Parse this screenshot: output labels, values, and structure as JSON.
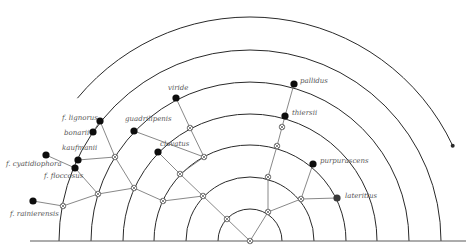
{
  "diagram": {
    "type": "phylogenetic-semicircle-tree",
    "center": {
      "x": 250,
      "y": 241
    },
    "radii": [
      32,
      64,
      96,
      127,
      159,
      191,
      224
    ],
    "colors": {
      "arc": "#2a2a2a",
      "edge": "#6a6a6a",
      "leaf": "#0d0d0d",
      "label": "#555555"
    },
    "leaves": [
      {
        "id": "f_lignorus",
        "label": "f. lignorus",
        "x": 100,
        "y": 121,
        "lx": 62,
        "ly": 120,
        "anchor": "start"
      },
      {
        "id": "bonarii",
        "label": "bonarii",
        "x": 93,
        "y": 132,
        "lx": 64,
        "ly": 135,
        "anchor": "start"
      },
      {
        "id": "kaufmanii",
        "label": "kaufmanii",
        "x": 78,
        "y": 160,
        "lx": 62,
        "ly": 150,
        "anchor": "start"
      },
      {
        "id": "f_floccosus",
        "label": "f. floccosus",
        "x": 75,
        "y": 168,
        "lx": 44,
        "ly": 178,
        "anchor": "start"
      },
      {
        "id": "f_cyatidiophora",
        "label": "f. cyatidiophora",
        "x": 46,
        "y": 155,
        "lx": 6,
        "ly": 166,
        "anchor": "start"
      },
      {
        "id": "f_rainierensis",
        "label": "f. rainierensis",
        "x": 33,
        "y": 201,
        "lx": 10,
        "ly": 216,
        "anchor": "start"
      },
      {
        "id": "guadrilipenis",
        "label": "guadrilipenis",
        "x": 134,
        "y": 131,
        "lx": 125,
        "ly": 121,
        "anchor": "start"
      },
      {
        "id": "viride",
        "label": "viride",
        "x": 176,
        "y": 98,
        "lx": 168,
        "ly": 90,
        "anchor": "start"
      },
      {
        "id": "clavatus",
        "label": "clavatus",
        "x": 158,
        "y": 152,
        "lx": 160,
        "ly": 146,
        "anchor": "start"
      },
      {
        "id": "pallidus",
        "label": "pallidus",
        "x": 294,
        "y": 84,
        "lx": 300,
        "ly": 83,
        "anchor": "start"
      },
      {
        "id": "thiersii",
        "label": "thiersii",
        "x": 285,
        "y": 116,
        "lx": 292,
        "ly": 115,
        "anchor": "start"
      },
      {
        "id": "purpurascens",
        "label": "purpurascens",
        "x": 313,
        "y": 164,
        "lx": 320,
        "ly": 163,
        "anchor": "start"
      },
      {
        "id": "lateritius",
        "label": "lateritius",
        "x": 337,
        "y": 198,
        "lx": 345,
        "ly": 198,
        "anchor": "start"
      }
    ],
    "internal_nodes": [
      {
        "id": "n0",
        "x": 250,
        "y": 241
      },
      {
        "id": "n1",
        "x": 227,
        "y": 219
      },
      {
        "id": "n2",
        "x": 268,
        "y": 212
      },
      {
        "id": "n3",
        "x": 203,
        "y": 196
      },
      {
        "id": "n4",
        "x": 268,
        "y": 177
      },
      {
        "id": "n5",
        "x": 301,
        "y": 199
      },
      {
        "id": "n6",
        "x": 180,
        "y": 174
      },
      {
        "id": "n7",
        "x": 163,
        "y": 201
      },
      {
        "id": "n8",
        "x": 277,
        "y": 146
      },
      {
        "id": "n9",
        "x": 204,
        "y": 157
      },
      {
        "id": "n10",
        "x": 134,
        "y": 188
      },
      {
        "id": "n11",
        "x": 190,
        "y": 128
      },
      {
        "id": "n12",
        "x": 115,
        "y": 157
      },
      {
        "id": "n13",
        "x": 98,
        "y": 194
      },
      {
        "id": "n14",
        "x": 63,
        "y": 206
      },
      {
        "id": "n15",
        "x": 282,
        "y": 127
      }
    ],
    "edges": [
      [
        "n0",
        "n1"
      ],
      [
        "n0",
        "n2"
      ],
      [
        "n1",
        "n3"
      ],
      [
        "n2",
        "n4"
      ],
      [
        "n2",
        "n5"
      ],
      [
        "n3",
        "n6"
      ],
      [
        "n3",
        "n7"
      ],
      [
        "n4",
        "n8"
      ],
      [
        "n5",
        "purpurascens"
      ],
      [
        "n5",
        "lateritius"
      ],
      [
        "n8",
        "thiersii"
      ],
      [
        "thiersii",
        "pallidus"
      ],
      [
        "n6",
        "n9"
      ],
      [
        "n6",
        "clavatus"
      ],
      [
        "n9",
        "n11"
      ],
      [
        "n11",
        "viride"
      ],
      [
        "n9",
        "guadrilipenis"
      ],
      [
        "n7",
        "n10"
      ],
      [
        "n10",
        "n12"
      ],
      [
        "n10",
        "n13"
      ],
      [
        "n12",
        "kaufmanii"
      ],
      [
        "n12",
        "f_lignorus"
      ],
      [
        "f_lignorus",
        "bonarii"
      ],
      [
        "n13",
        "f_floccosus"
      ],
      [
        "n13",
        "n14"
      ],
      [
        "n14",
        "f_rainierensis"
      ],
      [
        "f_floccosus",
        "f_cyatidiophora"
      ]
    ]
  }
}
